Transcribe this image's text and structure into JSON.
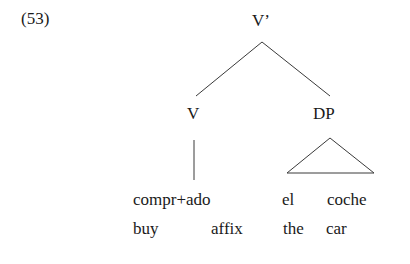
{
  "example_number": "(53)",
  "tree": {
    "root": {
      "label": "V’",
      "children": [
        {
          "label": "V",
          "terminal": {
            "morphemes": "compr+ado",
            "gloss_parts": [
              "buy",
              "affix"
            ]
          },
          "branch_type": "line"
        },
        {
          "label": "DP",
          "terminal": {
            "words": [
              "el",
              "coche"
            ],
            "gloss_parts": [
              "the",
              "car"
            ]
          },
          "branch_type": "triangle"
        }
      ]
    }
  }
}
